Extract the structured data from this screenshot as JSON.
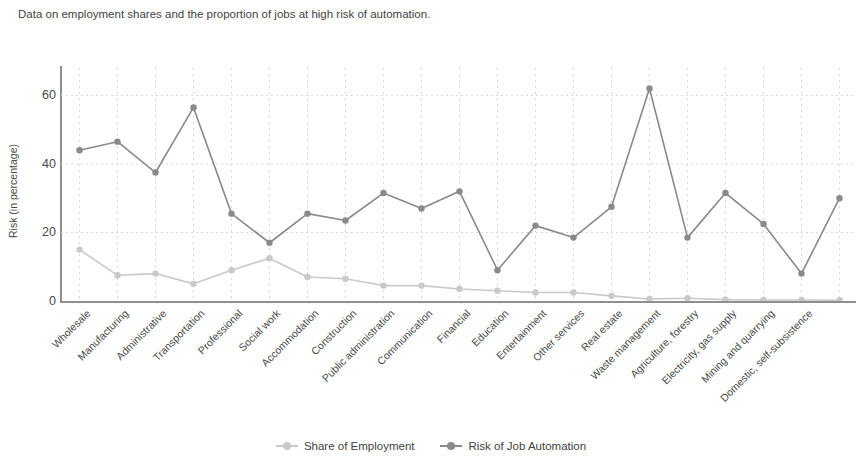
{
  "caption": "Data on employment shares and the proportion of jobs at high risk of automation.",
  "colors": {
    "share": "#c9c9c9",
    "risk": "#8a8a8a",
    "axis": "#8f8f8f",
    "grid": "#d8d8d8",
    "text": "#4a4a4a"
  },
  "legend": {
    "items": [
      {
        "label": "Share of Employment",
        "color": "#c9c9c9"
      },
      {
        "label": "Risk of Job Automation",
        "color": "#8a8a8a"
      }
    ]
  },
  "chart_data": {
    "type": "line",
    "title": "",
    "xlabel": "",
    "ylabel": "Risk (in percentage)",
    "ylim": [
      0,
      68
    ],
    "yticks": [
      0,
      20,
      40,
      60
    ],
    "grid": true,
    "legend_position": "bottom",
    "categories": [
      "Wholesale",
      "Manufacturing",
      "Administrative",
      "Transportation",
      "Professional",
      "Social work",
      "Accommodation",
      "Construction",
      "Public administration",
      "Communication",
      "Financial",
      "Education",
      "Entertainment",
      "Other services",
      "Real estate",
      "Waste management",
      "Agriculture, forestry",
      "Electricity, gas supply",
      "Mining and quarrying",
      "Domestic, self-subsistence",
      ""
    ],
    "series": [
      {
        "name": "Share of Employment",
        "color": "#c9c9c9",
        "values": [
          15,
          7.5,
          8,
          5,
          9,
          12.5,
          7,
          6.5,
          4.5,
          4.5,
          3.5,
          3,
          2.5,
          2.5,
          1.5,
          0.6,
          0.8,
          0.4,
          0.3,
          0.3,
          0.2
        ]
      },
      {
        "name": "Risk of Job Automation",
        "color": "#8a8a8a",
        "values": [
          44,
          46.5,
          37.5,
          56.5,
          25.5,
          17,
          25.5,
          23.5,
          31.5,
          27,
          32,
          9,
          22,
          18.5,
          27.5,
          62,
          18.5,
          31.5,
          22.5,
          8,
          30
        ]
      }
    ]
  }
}
